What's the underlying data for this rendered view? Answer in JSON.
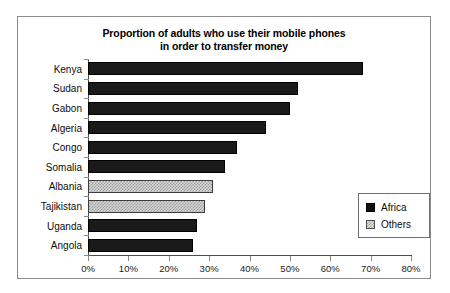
{
  "chart_data": {
    "type": "bar",
    "orientation": "horizontal",
    "title": "Proportion of adults who use their mobile phones in order to transfer money",
    "title_lines": [
      "Proportion of adults who use their mobile phones",
      "in order to transfer money"
    ],
    "xlabel": "",
    "ylabel": "",
    "xlim": [
      0,
      80
    ],
    "xtick_labels": [
      "0%",
      "10%",
      "20%",
      "30%",
      "40%",
      "50%",
      "60%",
      "70%",
      "80%"
    ],
    "xtick_values": [
      0,
      10,
      20,
      30,
      40,
      50,
      60,
      70,
      80
    ],
    "grid": false,
    "legend_position": "inside-bottom-right",
    "categories": [
      "Kenya",
      "Sudan",
      "Gabon",
      "Algeria",
      "Congo",
      "Somalia",
      "Albania",
      "Tajikistan",
      "Uganda",
      "Angola"
    ],
    "values": [
      68,
      52,
      50,
      44,
      37,
      34,
      31,
      29,
      27,
      26
    ],
    "groups": [
      "Africa",
      "Africa",
      "Africa",
      "Africa",
      "Africa",
      "Africa",
      "Others",
      "Others",
      "Africa",
      "Africa"
    ],
    "legend": [
      {
        "label": "Africa",
        "color": "#1a1a1a",
        "pattern": "solid"
      },
      {
        "label": "Others",
        "color": "#d5d5d5",
        "pattern": "checker"
      }
    ],
    "bars": [
      {
        "category": "Kenya",
        "value": 68,
        "group": "Africa"
      },
      {
        "category": "Sudan",
        "value": 52,
        "group": "Africa"
      },
      {
        "category": "Gabon",
        "value": 50,
        "group": "Africa"
      },
      {
        "category": "Algeria",
        "value": 44,
        "group": "Africa"
      },
      {
        "category": "Congo",
        "value": 37,
        "group": "Africa"
      },
      {
        "category": "Somalia",
        "value": 34,
        "group": "Africa"
      },
      {
        "category": "Albania",
        "value": 31,
        "group": "Others"
      },
      {
        "category": "Tajikistan",
        "value": 29,
        "group": "Others"
      },
      {
        "category": "Uganda",
        "value": 27,
        "group": "Africa"
      },
      {
        "category": "Angola",
        "value": 26,
        "group": "Africa"
      }
    ]
  }
}
